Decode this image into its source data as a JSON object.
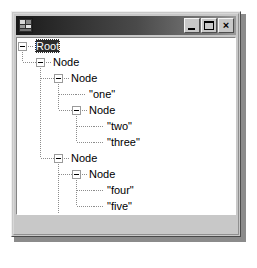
{
  "window": {
    "title": "",
    "icon": "application-icon",
    "controls": {
      "minimize_label": "_",
      "maximize_label": "□",
      "close_label": "×"
    }
  },
  "tree": {
    "name": "treeview",
    "row_height": 16,
    "indent": 18,
    "nodes": [
      {
        "id": "n0",
        "label": "Root",
        "depth": 0,
        "expander": true,
        "selected": true,
        "last": true
      },
      {
        "id": "n1",
        "label": "Node",
        "depth": 1,
        "expander": true,
        "selected": false,
        "last": true
      },
      {
        "id": "n2",
        "label": "Node",
        "depth": 2,
        "expander": true,
        "selected": false,
        "last": false
      },
      {
        "id": "n3",
        "label": "\"one\"",
        "depth": 3,
        "expander": false,
        "selected": false,
        "last": false
      },
      {
        "id": "n4",
        "label": "Node",
        "depth": 3,
        "expander": true,
        "selected": false,
        "last": true
      },
      {
        "id": "n5",
        "label": "\"two\"",
        "depth": 4,
        "expander": false,
        "selected": false,
        "last": false
      },
      {
        "id": "n6",
        "label": "\"three\"",
        "depth": 4,
        "expander": false,
        "selected": false,
        "last": true
      },
      {
        "id": "n7",
        "label": "Node",
        "depth": 2,
        "expander": true,
        "selected": false,
        "last": true
      },
      {
        "id": "n8",
        "label": "Node",
        "depth": 3,
        "expander": true,
        "selected": false,
        "last": false
      },
      {
        "id": "n9",
        "label": "\"four\"",
        "depth": 4,
        "expander": false,
        "selected": false,
        "last": false
      },
      {
        "id": "n10",
        "label": "\"five\"",
        "depth": 4,
        "expander": false,
        "selected": false,
        "last": true
      },
      {
        "id": "n11",
        "label": "\"six\"",
        "depth": 3,
        "expander": false,
        "selected": false,
        "last": true
      }
    ]
  },
  "colors": {
    "window_face": "#c8c8c8",
    "client_bg": "#ffffff",
    "selection_bg": "#2b2b2b",
    "selection_fg": "#ffffff",
    "line": "#8c8c8c",
    "text": "#000000"
  }
}
